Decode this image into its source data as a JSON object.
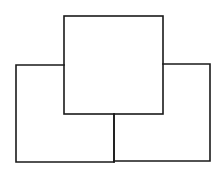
{
  "diagram": {
    "line_color": "#1a1a1a",
    "background_color": "#ffffff",
    "shapes": [
      {
        "name": "top-square"
      },
      {
        "name": "left-rectangle"
      },
      {
        "name": "right-rectangle"
      }
    ]
  }
}
